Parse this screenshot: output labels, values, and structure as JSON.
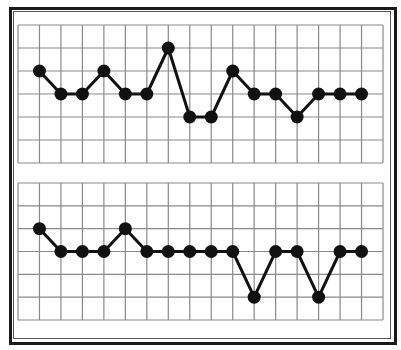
{
  "chart_data": [
    {
      "type": "line",
      "title": "",
      "xlabel": "",
      "ylabel": "",
      "grid": true,
      "grid_columns": 17,
      "grid_rows": 6,
      "ylim": [
        0,
        6
      ],
      "x": [
        1,
        2,
        3,
        4,
        5,
        6,
        7,
        8,
        9,
        10,
        11,
        12,
        13,
        14,
        15,
        16
      ],
      "series": [
        {
          "name": "upper",
          "values": [
            4,
            3,
            3,
            4,
            3,
            3,
            5,
            2,
            2,
            4,
            3,
            3,
            2,
            3,
            3,
            3
          ]
        }
      ],
      "marker": "filled-circle",
      "line_color": "#111111",
      "grid_color": "#8a8a8a"
    },
    {
      "type": "line",
      "title": "",
      "xlabel": "",
      "ylabel": "",
      "grid": true,
      "grid_columns": 17,
      "grid_rows": 6,
      "ylim": [
        0,
        6
      ],
      "x": [
        1,
        2,
        3,
        4,
        5,
        6,
        7,
        8,
        9,
        10,
        11,
        12,
        13,
        14,
        15,
        16
      ],
      "series": [
        {
          "name": "lower",
          "values": [
            4,
            3,
            3,
            3,
            4,
            3,
            3,
            3,
            3,
            3,
            1,
            3,
            3,
            1,
            3,
            3
          ]
        }
      ],
      "marker": "filled-circle",
      "line_color": "#111111",
      "grid_color": "#8a8a8a"
    }
  ],
  "panels": [
    {
      "left": 18,
      "top": 25,
      "width": 365,
      "height": 138
    },
    {
      "left": 18,
      "top": 183,
      "width": 365,
      "height": 137
    }
  ]
}
